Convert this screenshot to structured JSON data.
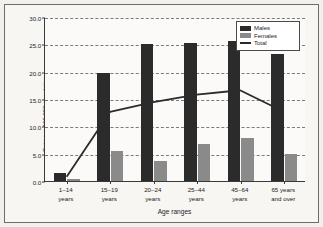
{
  "chart_data": {
    "type": "bar",
    "title": "",
    "xlabel": "Age ranges",
    "ylabel": "Rate per 100,000 population",
    "categories": [
      "1–14\nyears",
      "15–19\nyears",
      "20–24\nyears",
      "25–44\nyears",
      "45–64\nyears",
      "65 years\nand over"
    ],
    "ylim": [
      0,
      30
    ],
    "yticks": [
      "0.0",
      "5.0",
      "10.0",
      "15.0",
      "20.0",
      "25.0",
      "30.0"
    ],
    "ytick_values": [
      0,
      5,
      10,
      15,
      20,
      25,
      30
    ],
    "grid": true,
    "legend_position": "top-right",
    "series": [
      {
        "name": "Males",
        "type": "bar",
        "color": "#2b2b2b",
        "values": [
          1.4,
          19.8,
          25.0,
          25.2,
          25.6,
          23.3
        ]
      },
      {
        "name": "Females",
        "type": "bar",
        "color": "#8a8a8a",
        "values": [
          0.3,
          5.5,
          3.7,
          6.8,
          7.8,
          4.9
        ]
      },
      {
        "name": "Total",
        "type": "line",
        "color": "#2b2b2b",
        "values": [
          0.8,
          12.7,
          14.5,
          15.9,
          16.7,
          12.8
        ]
      }
    ]
  },
  "legend": {
    "items": [
      {
        "label": "Males",
        "marker": "bar-swatch-dark"
      },
      {
        "label": "Females",
        "marker": "bar-swatch-gray"
      },
      {
        "label": "Total",
        "marker": "line-swatch"
      }
    ]
  }
}
